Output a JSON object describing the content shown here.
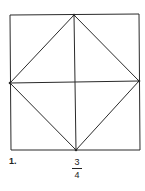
{
  "figure": {
    "number_label": "1.",
    "fraction": {
      "numerator": "3",
      "denominator": "4"
    },
    "stroke_color": "#2a2a2a",
    "square": {
      "x1": 10,
      "y1": 15,
      "x2": 139,
      "y2": 150
    },
    "inscribed_diamond": {
      "top": [
        74,
        15
      ],
      "right": [
        139,
        82
      ],
      "bottom": [
        76,
        150
      ],
      "left": [
        10,
        83
      ]
    },
    "midlines": [
      "vertical",
      "horizontal"
    ]
  }
}
